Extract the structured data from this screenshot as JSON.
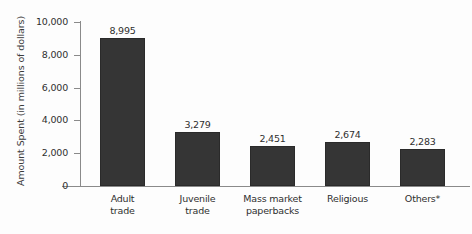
{
  "chart_data": {
    "type": "bar",
    "title": "",
    "xlabel": "",
    "ylabel": "Amount Spent (in millions of dollars)",
    "categories": [
      "Adult trade",
      "Juvenile trade",
      "Mass market paperbacks",
      "Religious",
      "Others*"
    ],
    "category_lines": [
      [
        "Adult",
        "trade"
      ],
      [
        "Juvenile",
        "trade"
      ],
      [
        "Mass market",
        "paperbacks"
      ],
      [
        "Religious",
        ""
      ],
      [
        "Others*",
        ""
      ]
    ],
    "values": [
      8995,
      3279,
      2451,
      2674,
      2283
    ],
    "value_labels": [
      "8,995",
      "3,279",
      "2,451",
      "2,674",
      "2,283"
    ],
    "ylim": [
      0,
      10000
    ],
    "ytick_values": [
      10000,
      8000,
      6000,
      4000,
      2000,
      0
    ],
    "ytick_labels": [
      "10,000",
      "8,000",
      "6,000",
      "4,000",
      "2,000",
      "0"
    ],
    "grid": false,
    "legend": "none",
    "bar_color": "#353535",
    "axis_color": "#8a8a8a",
    "text_color": "#2f2f2f",
    "background_color": "#fdfdfd"
  }
}
